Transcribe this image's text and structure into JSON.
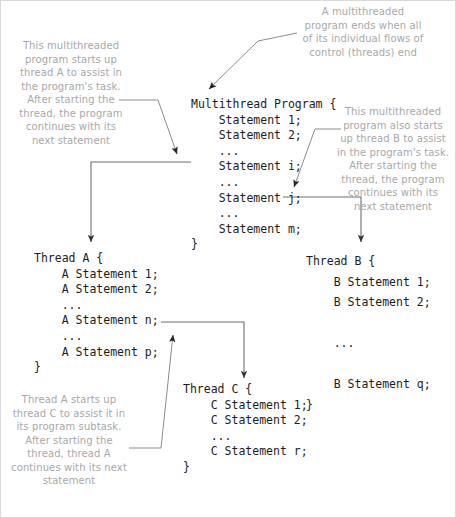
{
  "diagram": {
    "background_color": "#ffffff",
    "code_color": "#1c1c1c",
    "annotation_color": "#a8a8a8",
    "connector_color": "#808080"
  },
  "notes": {
    "top": "A multithreaded\nprogram ends when all\nof its individual flows of\ncontrol (threads) end",
    "left": "This multithreaded\nprogram starts up\nthread A to assist in\nthe program's task.\nAfter starting the\nthread, the program\ncontinues with its\nnext statement",
    "right": "This multithreaded\nprogram also starts\nup thread B to assist\nin the program's task.\nAfter starting the\nthread, the program\ncontinues with its\nnext statement",
    "bottom_left": "Thread A starts up\nthread C to assist it in\nits program subtask.\nAfter starting the\nthread, thread A\ncontinues with its next\nstatement"
  },
  "blocks": {
    "main": {
      "name": "Multithread Program",
      "code": "Multithread Program {\n    Statement 1;\n    Statement 2;\n    ...\n    Statement i;\n    ...\n    Statement j;\n    ...\n    Statement m;\n}"
    },
    "thread_a": {
      "name": "Thread A",
      "code": "Thread A {\n    A Statement 1;\n    A Statement 2;\n    ...\n    A Statement n;\n    ...\n    A Statement p;\n}"
    },
    "thread_b": {
      "name": "Thread B",
      "code": "Thread B {\n    B Statement 1;\n    B Statement 2;\n\n    ...\n\n    B Statement q;\n}"
    },
    "thread_c": {
      "name": "Thread C",
      "code": "Thread C {\n    C Statement 1;\n    C Statement 2;\n    ...\n    C Statement r;\n}"
    }
  }
}
